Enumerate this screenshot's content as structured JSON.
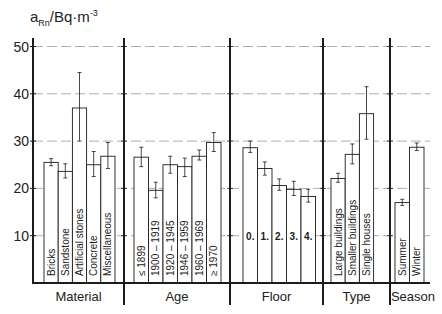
{
  "chart_data": {
    "type": "bar",
    "title": "",
    "ylabel": "a_Rn / Bq·m^-3",
    "ylabel_parts": {
      "base": "a",
      "sub": "Rn",
      "unit": "/Bq·m",
      "sup": "-3"
    },
    "ylim": [
      0,
      52
    ],
    "yticks": [
      10,
      20,
      30,
      40,
      50
    ],
    "grid": true,
    "groups": [
      {
        "name": "Material",
        "categories": [
          "Bricks",
          "Sandstone",
          "Artificial stones",
          "Concrete",
          "Miscellaneous"
        ],
        "values": [
          25.5,
          23.6,
          37.0,
          25.0,
          26.8
        ],
        "err_low": [
          24.8,
          22.2,
          30.0,
          22.5,
          24.2
        ],
        "err_high": [
          26.3,
          25.2,
          44.5,
          27.8,
          29.7
        ]
      },
      {
        "name": "Age",
        "categories": [
          "≤ 1899",
          "1900 – 1919",
          "1920 – 1945",
          "1946 – 1959",
          "1960 – 1969",
          "≥ 1970"
        ],
        "values": [
          26.6,
          19.6,
          25.0,
          24.6,
          26.8,
          29.7
        ],
        "err_low": [
          24.6,
          18.0,
          23.2,
          22.5,
          26.0,
          27.8
        ],
        "err_high": [
          28.7,
          21.3,
          26.8,
          26.4,
          28.1,
          31.8
        ]
      },
      {
        "name": "Floor",
        "categories": [
          "0.",
          "1.",
          "2.",
          "3.",
          "4."
        ],
        "values": [
          28.6,
          24.2,
          20.6,
          19.8,
          18.3
        ],
        "err_low": [
          27.6,
          22.8,
          19.6,
          18.5,
          17.1
        ],
        "err_high": [
          30.0,
          25.6,
          22.0,
          21.5,
          19.8
        ]
      },
      {
        "name": "Type",
        "categories": [
          "Large buildings",
          "Smaller buildings",
          "Single houses"
        ],
        "values": [
          22.1,
          27.2,
          35.8
        ],
        "err_low": [
          21.3,
          25.2,
          30.4
        ],
        "err_high": [
          23.2,
          29.4,
          41.5
        ]
      },
      {
        "name": "Season",
        "categories": [
          "Summer",
          "Winter"
        ],
        "values": [
          17.0,
          28.7
        ],
        "err_low": [
          16.4,
          28.0
        ],
        "err_high": [
          17.7,
          29.6
        ]
      }
    ]
  }
}
